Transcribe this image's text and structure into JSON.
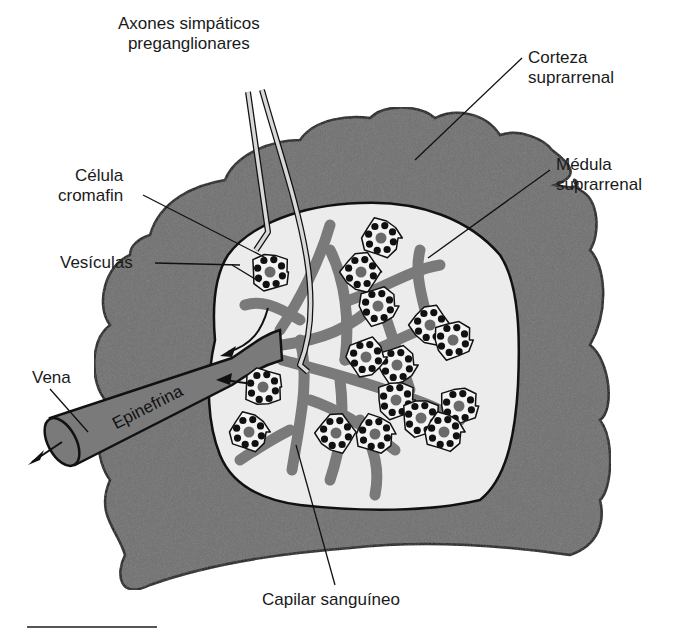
{
  "figure": {
    "labels": {
      "axons": [
        "Axones simpáticos",
        "preganglionares"
      ],
      "cortex": [
        "Corteza",
        "suprarrenal"
      ],
      "medulla": [
        "Médula",
        "suprarrenal"
      ],
      "chromaffin_cell": [
        "Célula",
        "cromafin"
      ],
      "vesicles": "Vesículas",
      "vein": "Vena",
      "epinephrine": "Epinefrina",
      "capillary": "Capilar sanguíneo"
    },
    "colors": {
      "cortex_fill": "#6e6e6e",
      "medulla_fill": "#ececec",
      "vessel_fill": "#7a7a7a",
      "cell_fill": "#f4f4f4",
      "vesicle_fill": "#111111",
      "nucleus_fill": "#6a6a6a",
      "axon_fill": "#d8d8d8",
      "outline": "#111111"
    }
  }
}
